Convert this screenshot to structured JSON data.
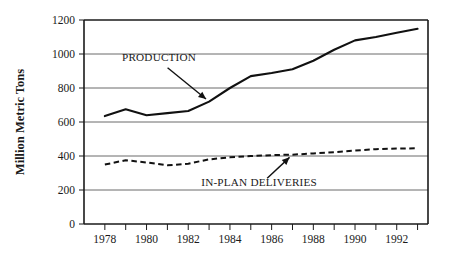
{
  "chart_data": {
    "type": "line",
    "title": "",
    "subtitle": "",
    "xlabel": "",
    "ylabel": "Million Metric Tons",
    "xlim": [
      1977,
      1993.5
    ],
    "ylim": [
      0,
      1200
    ],
    "grid": true,
    "grid_axis": "y",
    "legend_position": "inline-annotations",
    "x_tick_labels": [
      "1978",
      "1980",
      "1982",
      "1984",
      "1986",
      "1988",
      "1990",
      "1992"
    ],
    "x_tick_values": [
      1978,
      1980,
      1982,
      1984,
      1986,
      1988,
      1990,
      1992
    ],
    "x_minor_tick_values": [
      1979,
      1981,
      1983,
      1985,
      1987,
      1989,
      1991,
      1993
    ],
    "y_tick_labels": [
      "0",
      "200",
      "400",
      "600",
      "800",
      "1000",
      "1200"
    ],
    "y_tick_values": [
      0,
      200,
      400,
      600,
      800,
      1000,
      1200
    ],
    "x": [
      1978,
      1979,
      1980,
      1981,
      1982,
      1983,
      1984,
      1985,
      1986,
      1987,
      1988,
      1989,
      1990,
      1991,
      1992,
      1993
    ],
    "series": [
      {
        "name": "PRODUCTION",
        "style": "solid",
        "values": [
          635,
          675,
          640,
          652,
          665,
          720,
          800,
          870,
          888,
          910,
          960,
          1025,
          1080,
          1100,
          1125,
          1148
        ]
      },
      {
        "name": "IN-PLAN DELIVERIES",
        "style": "dashed",
        "values": [
          350,
          375,
          362,
          345,
          355,
          380,
          392,
          400,
          405,
          408,
          415,
          422,
          432,
          440,
          444,
          445
        ]
      }
    ],
    "annotations": [
      {
        "text": "PRODUCTION",
        "target_x": 1983.0,
        "target_y": 720,
        "label_x": 1980.6,
        "label_y": 960
      },
      {
        "text": "IN-PLAN DELIVERIES",
        "target_x": 1987.0,
        "target_y": 408,
        "label_x": 1985.4,
        "label_y": 225
      }
    ],
    "colors": {
      "background": "#ffffff",
      "axis": "#1a1a1a",
      "gridline": "#6b6b6b",
      "production_line": "#111111",
      "deliveries_line": "#111111",
      "text": "#1a1a1a"
    }
  }
}
